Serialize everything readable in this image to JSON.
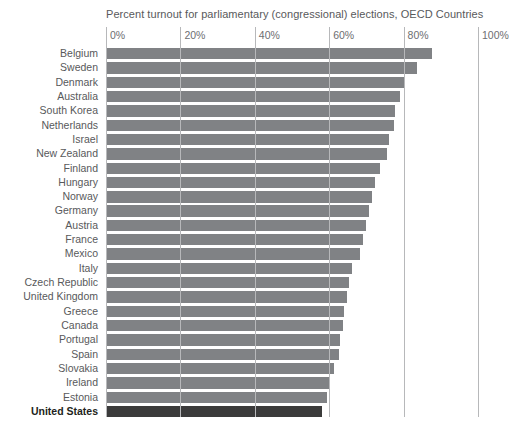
{
  "chart_data": {
    "type": "bar",
    "orientation": "horizontal",
    "title": "Percent turnout for parliamentary (congressional) elections, OECD Countries",
    "xlabel": "",
    "ylabel": "",
    "xlim": [
      0,
      100
    ],
    "grid": true,
    "legend": "none",
    "tick_labels": [
      "0%",
      "20%",
      "40%",
      "60%",
      "80%",
      "100%"
    ],
    "tick_values": [
      0,
      20,
      40,
      60,
      80,
      100
    ],
    "categories": [
      "Belgium",
      "Sweden",
      "Denmark",
      "Australia",
      "South Korea",
      "Netherlands",
      "Israel",
      "New Zealand",
      "Finland",
      "Hungary",
      "Norway",
      "Germany",
      "Austria",
      "France",
      "Mexico",
      "Italy",
      "Czech Republic",
      "United Kingdom",
      "Greece",
      "Canada",
      "Portugal",
      "Spain",
      "Slovakia",
      "Ireland",
      "Estonia",
      "United States"
    ],
    "values": [
      87.5,
      83.5,
      80.3,
      79.0,
      77.8,
      77.3,
      76.1,
      75.5,
      73.7,
      72.4,
      71.6,
      70.8,
      70.0,
      69.2,
      68.4,
      66.0,
      65.4,
      64.8,
      64.0,
      63.6,
      63.0,
      62.5,
      61.2,
      60.1,
      59.5,
      58.0
    ],
    "highlight_category": "United States",
    "colors": {
      "bar": "#808285",
      "bar_highlight": "#3b3b3b",
      "gridline": "#b7b8ba",
      "text": "#58595b",
      "text_highlight": "#231f20",
      "background": "#ffffff"
    }
  }
}
